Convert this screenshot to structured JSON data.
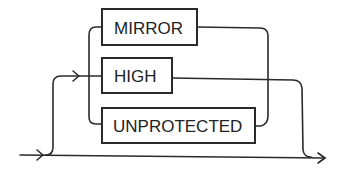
{
  "diagram": {
    "type": "syntax-railroad",
    "options": [
      {
        "label": "MIRROR"
      },
      {
        "label": "HIGH"
      },
      {
        "label": "UNPROTECTED"
      }
    ],
    "colors": {
      "line": "#2a2a2a",
      "background": "#ffffff"
    }
  }
}
